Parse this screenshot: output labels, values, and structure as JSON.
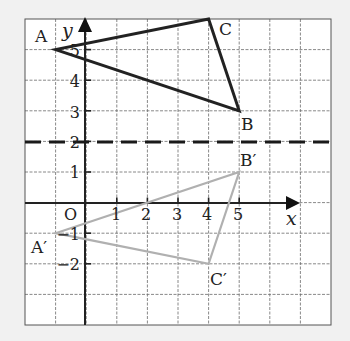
{
  "diagram": {
    "type": "coordinate-grid-reflection",
    "grid": {
      "x_min": -2,
      "x_max": 8,
      "y_min": -4,
      "y_max": 6
    },
    "axes": {
      "x_label": "x",
      "y_label": "y",
      "origin_label": "O",
      "x_ticks": [
        "1",
        "2",
        "3",
        "4",
        "5"
      ],
      "y_ticks": [
        "5",
        "4",
        "3",
        "2",
        "1",
        "−1",
        "−2"
      ]
    },
    "mirror_line": {
      "equation": "y = 2",
      "style": "dashed"
    },
    "triangle_original": {
      "color": "#222222",
      "vertices": [
        {
          "label": "A",
          "x": -1,
          "y": 5
        },
        {
          "label": "B",
          "x": 5,
          "y": 3
        },
        {
          "label": "C",
          "x": 4,
          "y": 6
        }
      ]
    },
    "triangle_image": {
      "color": "#b0b0b0",
      "vertices": [
        {
          "label": "A′",
          "x": -1,
          "y": -1
        },
        {
          "label": "B′",
          "x": 5,
          "y": 1
        },
        {
          "label": "C′",
          "x": 4,
          "y": -2
        }
      ]
    }
  }
}
